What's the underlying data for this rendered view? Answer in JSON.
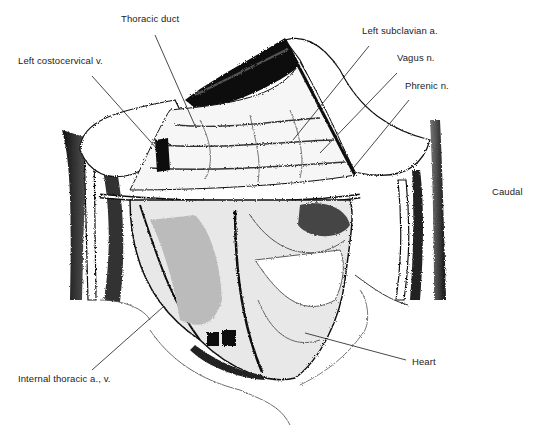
{
  "figure": {
    "orientation_label": "Caudal",
    "labels": [
      {
        "id": "thoracic-duct",
        "text": "Thoracic duct",
        "x": 121,
        "y": 19,
        "line": [
          155,
          35,
          196,
          128
        ]
      },
      {
        "id": "left-costocervical-v",
        "text": "Left costocervical v.",
        "x": 18,
        "y": 61,
        "line": [
          92,
          76,
          158,
          150
        ]
      },
      {
        "id": "left-subclavian-a",
        "text": "Left subclavian a.",
        "x": 362,
        "y": 31,
        "line": [
          369,
          46,
          293,
          140
        ]
      },
      {
        "id": "vagus-n",
        "text": "Vagus n.",
        "x": 397,
        "y": 58,
        "line": [
          397,
          73,
          320,
          153
        ]
      },
      {
        "id": "phrenic-n",
        "text": "Phrenic n.",
        "x": 405,
        "y": 86,
        "line": [
          409,
          100,
          350,
          172
        ]
      },
      {
        "id": "internal-thoracic-a-v",
        "text": "Internal thoracic a., v.",
        "x": 18,
        "y": 375,
        "line": [
          92,
          370,
          163,
          307
        ]
      },
      {
        "id": "heart",
        "text": "Heart",
        "x": 412,
        "y": 358,
        "line": [
          406,
          360,
          305,
          333
        ]
      }
    ],
    "caudal": {
      "text": "Caudal",
      "x": 493,
      "y": 191
    }
  }
}
